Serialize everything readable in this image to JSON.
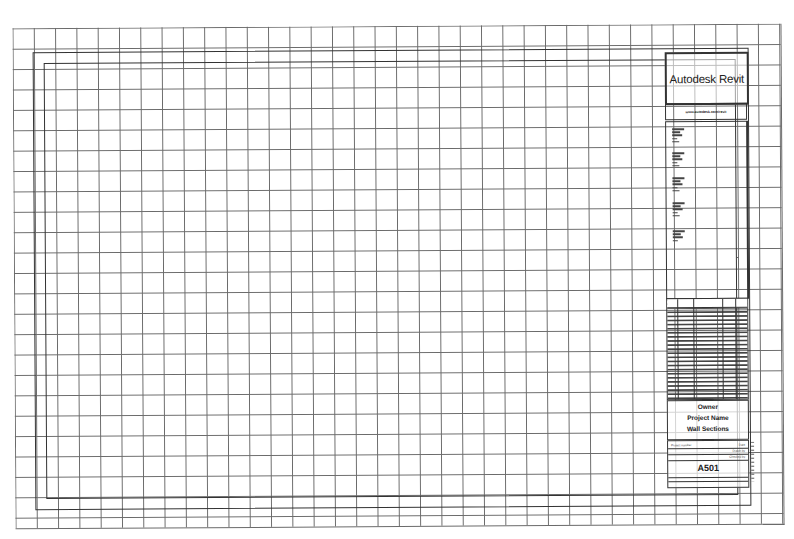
{
  "sheet": {
    "type": "architectural-drawing-sheet",
    "grid": {
      "cell_width_px": 21,
      "cell_height_px": 20,
      "line_color": "#6a6a6a"
    },
    "border_color": "#333333"
  },
  "title_block": {
    "logo_text": "Autodesk Revit",
    "logo_subtext": "www.autodesk.com/revit",
    "notes_count": 5,
    "revision_table_rows": 24,
    "owner": "Owner",
    "project_name": "Project Name",
    "sheet_name": "Wall Sections",
    "labels": {
      "project_number": "Project number",
      "date": "Date",
      "drawn_by": "Drawn by",
      "checked_by": "Checked by"
    },
    "sheet_number": "A501"
  }
}
